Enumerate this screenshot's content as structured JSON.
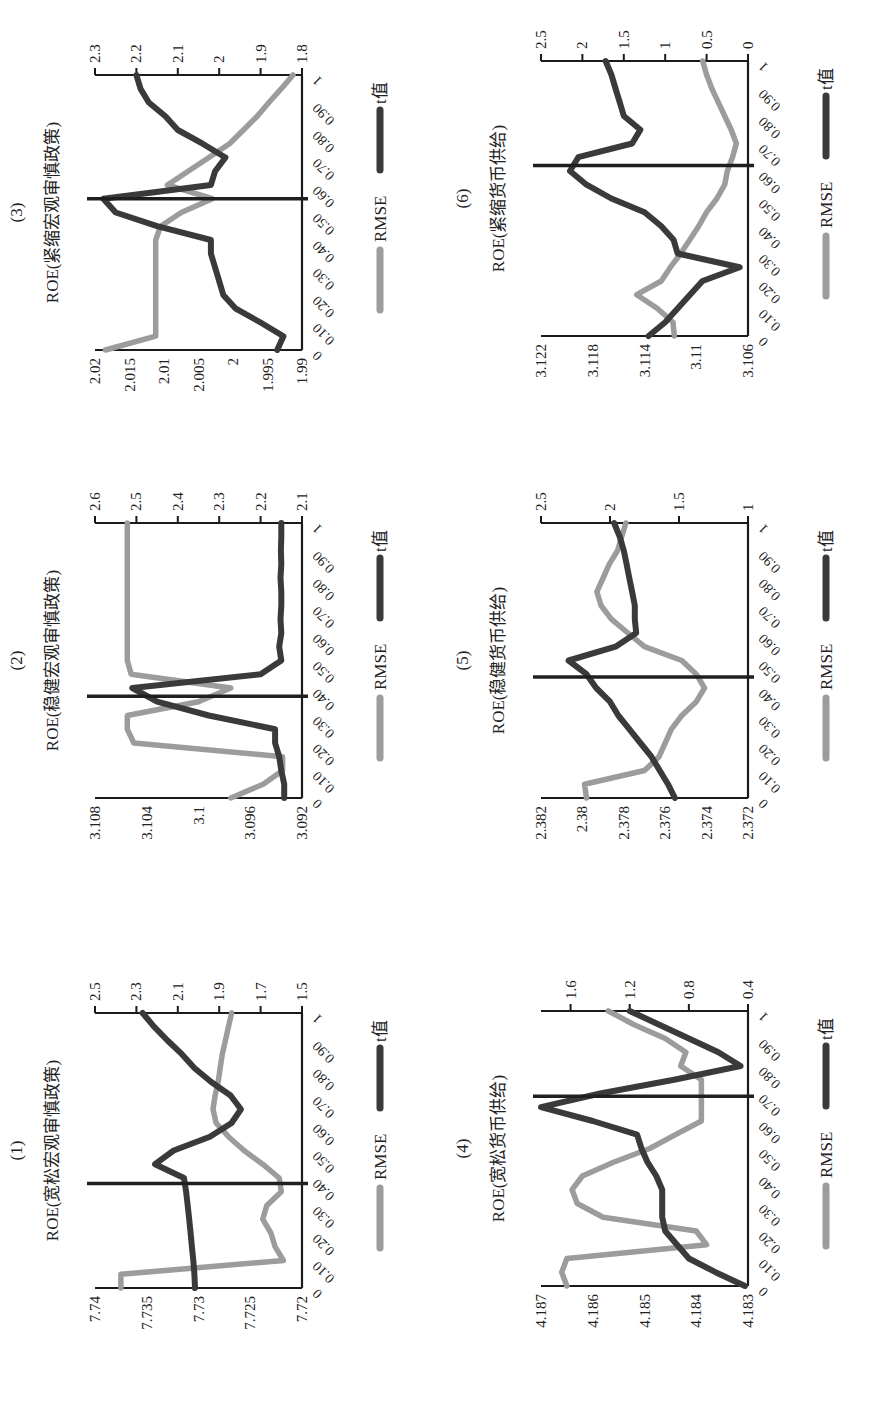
{
  "figure": {
    "legend": {
      "rmse_label": "RMSE",
      "t_label": "t值"
    },
    "colors": {
      "rmse": "#9c9c9c",
      "t": "#3a3a3a",
      "axis": "#1a1a1a",
      "marker": "#1f1f1f"
    }
  },
  "chart_data": [
    {
      "id": "1",
      "number": "(1)",
      "title": "ROE(宽松宏观审慎政策)",
      "type": "line",
      "x": [
        0,
        0.05,
        0.1,
        0.15,
        0.2,
        0.25,
        0.3,
        0.35,
        0.4,
        0.45,
        0.5,
        0.55,
        0.6,
        0.65,
        0.7,
        0.75,
        0.8,
        0.85,
        0.9,
        0.95,
        1
      ],
      "x_tick_labels": [
        "0",
        "0.10",
        "0.20",
        "0.30",
        "0.40",
        "0.50",
        "0.60",
        "0.70",
        "0.80",
        "0.90",
        "1"
      ],
      "y_left": {
        "ticks": [
          "7.74",
          "7.735",
          "7.73",
          "7.725",
          "7.72"
        ],
        "range": [
          7.72,
          7.74
        ]
      },
      "y_right": {
        "ticks": [
          "2.5",
          "2.3",
          "2.1",
          "1.9",
          "1.7",
          "1.5"
        ],
        "range": [
          1.5,
          2.5
        ]
      },
      "marker_x": 0.38,
      "series": [
        {
          "name": "RMSE",
          "axis": "left",
          "values": [
            7.7375,
            7.7375,
            7.7218,
            7.7226,
            7.723,
            7.7238,
            7.7234,
            7.722,
            7.7222,
            7.7238,
            7.7256,
            7.7271,
            7.7283,
            7.7286,
            7.7284,
            7.7281,
            7.7279,
            7.7277,
            7.7274,
            7.7271,
            7.7268
          ]
        },
        {
          "name": "t值",
          "axis": "right",
          "values": [
            2.017,
            2.02,
            2.025,
            2.032,
            2.038,
            2.045,
            2.052,
            2.06,
            2.07,
            2.21,
            2.12,
            1.945,
            1.84,
            1.795,
            1.845,
            1.94,
            2.02,
            2.08,
            2.15,
            2.215,
            2.27
          ]
        }
      ],
      "xlabel": "",
      "grid": false,
      "legend_position": "bottom"
    },
    {
      "id": "2",
      "number": "(2)",
      "title": "ROE(稳健宏观审慎政策)",
      "type": "line",
      "x": [
        0,
        0.05,
        0.1,
        0.15,
        0.2,
        0.25,
        0.3,
        0.35,
        0.4,
        0.45,
        0.5,
        0.55,
        0.6,
        0.65,
        0.7,
        0.75,
        0.8,
        0.85,
        0.9,
        0.95,
        1
      ],
      "x_tick_labels": [
        "0",
        "0.10",
        "0.20",
        "0.30",
        "0.40",
        "0.50",
        "0.60",
        "0.70",
        "0.80",
        "0.90",
        "1"
      ],
      "y_left": {
        "ticks": [
          "3.108",
          "3.104",
          "3.1",
          "3.096",
          "3.092"
        ],
        "range": [
          3.092,
          3.108
        ]
      },
      "y_right": {
        "ticks": [
          "2.6",
          "2.5",
          "2.4",
          "2.3",
          "2.2",
          "2.1"
        ],
        "range": [
          2.1,
          2.6
        ]
      },
      "marker_x": 0.37,
      "series": [
        {
          "name": "RMSE",
          "axis": "left",
          "values": [
            3.0975,
            3.095,
            3.0935,
            3.0935,
            3.105,
            3.1055,
            3.1055,
            3.1,
            3.0975,
            3.1052,
            3.1055,
            3.1055,
            3.1055,
            3.1055,
            3.1055,
            3.1055,
            3.1055,
            3.1055,
            3.1055,
            3.1055,
            3.1055
          ]
        },
        {
          "name": "t值",
          "axis": "right",
          "values": [
            2.143,
            2.143,
            2.15,
            2.155,
            2.165,
            2.165,
            2.325,
            2.45,
            2.51,
            2.2,
            2.15,
            2.155,
            2.15,
            2.152,
            2.15,
            2.15,
            2.152,
            2.15,
            2.151,
            2.15,
            2.15
          ]
        }
      ],
      "xlabel": "",
      "grid": false,
      "legend_position": "bottom"
    },
    {
      "id": "3",
      "number": "(3)",
      "title": "ROE(紧缩宏观审慎政策)",
      "type": "line",
      "x": [
        0,
        0.05,
        0.1,
        0.15,
        0.2,
        0.25,
        0.3,
        0.35,
        0.4,
        0.45,
        0.5,
        0.55,
        0.6,
        0.65,
        0.7,
        0.75,
        0.8,
        0.85,
        0.9,
        0.95,
        1
      ],
      "x_tick_labels": [
        "0",
        "0.10",
        "0.20",
        "0.30",
        "0.40",
        "0.50",
        "0.60",
        "0.70",
        "0.80",
        "0.90",
        "1"
      ],
      "y_left": {
        "ticks": [
          "2.02",
          "2.015",
          "2.01",
          "2.005",
          "2",
          "1.995",
          "1.99"
        ],
        "range": [
          1.99,
          2.02
        ]
      },
      "y_right": {
        "ticks": [
          "2.3",
          "2.2",
          "2.1",
          "2",
          "1.9",
          "1.8"
        ],
        "range": [
          1.8,
          2.3
        ]
      },
      "marker_x": 0.55,
      "series": [
        {
          "name": "RMSE",
          "axis": "left",
          "values": [
            2.0185,
            2.0112,
            2.0112,
            2.0112,
            2.0112,
            2.0112,
            2.0112,
            2.0112,
            2.0112,
            2.0105,
            2.0075,
            2.003,
            2.0095,
            2.0065,
            2.0035,
            2.0005,
            1.9985,
            1.9965,
            1.9948,
            1.993,
            1.9913
          ]
        },
        {
          "name": "t值",
          "axis": "right",
          "values": [
            1.86,
            1.845,
            1.9,
            1.96,
            1.99,
            2.0,
            2.01,
            2.02,
            2.02,
            2.15,
            2.25,
            2.28,
            2.02,
            2.01,
            1.985,
            2.04,
            2.1,
            2.13,
            2.17,
            2.19,
            2.2
          ]
        }
      ],
      "xlabel": "",
      "grid": false,
      "legend_position": "bottom"
    },
    {
      "id": "4",
      "number": "(4)",
      "title": "ROE(宽松货币供给)",
      "type": "line",
      "x": [
        0,
        0.05,
        0.1,
        0.15,
        0.2,
        0.25,
        0.3,
        0.35,
        0.4,
        0.45,
        0.5,
        0.55,
        0.6,
        0.65,
        0.7,
        0.75,
        0.8,
        0.85,
        0.9,
        0.95,
        1
      ],
      "x_tick_labels": [
        "0",
        "0.10",
        "0.20",
        "0.30",
        "0.40",
        "0.50",
        "0.60",
        "0.70",
        "0.80",
        "0.90",
        "1"
      ],
      "y_left": {
        "ticks": [
          "4.187",
          "4.186",
          "4.185",
          "4.184",
          "4.183"
        ],
        "range": [
          4.183,
          4.187
        ]
      },
      "y_right": {
        "ticks": [
          "1.6",
          "1.2",
          "0.8",
          "0.4"
        ],
        "range": [
          0.4,
          1.8
        ]
      },
      "marker_x": 0.69,
      "series": [
        {
          "name": "RMSE",
          "axis": "left",
          "values": [
            4.1865,
            4.1866,
            4.1865,
            4.1838,
            4.184,
            4.1858,
            4.1863,
            4.1864,
            4.1862,
            4.1856,
            4.1849,
            4.1844,
            4.1839,
            4.1839,
            4.1839,
            4.1839,
            4.1843,
            4.1842,
            4.1846,
            4.1852,
            4.1857
          ]
        },
        {
          "name": "t值",
          "axis": "right",
          "values": [
            0.42,
            0.62,
            0.8,
            0.88,
            0.96,
            0.98,
            0.98,
            0.98,
            1.02,
            1.08,
            1.12,
            1.15,
            1.45,
            1.8,
            1.4,
            0.9,
            0.45,
            0.6,
            0.8,
            1.0,
            1.2
          ]
        }
      ],
      "xlabel": "",
      "grid": false,
      "legend_position": "bottom"
    },
    {
      "id": "5",
      "number": "(5)",
      "title": "ROE(稳健货币供给)",
      "type": "line",
      "x": [
        0,
        0.05,
        0.1,
        0.15,
        0.2,
        0.25,
        0.3,
        0.35,
        0.4,
        0.45,
        0.5,
        0.55,
        0.6,
        0.65,
        0.7,
        0.75,
        0.8,
        0.85,
        0.9,
        0.95,
        1
      ],
      "x_tick_labels": [
        "0",
        "0.10",
        "0.20",
        "0.30",
        "0.40",
        "0.50",
        "0.60",
        "0.70",
        "0.80",
        "0.90",
        "1"
      ],
      "y_left": {
        "ticks": [
          "2.382",
          "2.38",
          "2.378",
          "2.376",
          "2.374",
          "2.372"
        ],
        "range": [
          2.372,
          2.382
        ]
      },
      "y_right": {
        "ticks": [
          "2.5",
          "2",
          "1.5",
          "1"
        ],
        "range": [
          1.0,
          2.5
        ]
      },
      "marker_x": 0.44,
      "series": [
        {
          "name": "RMSE",
          "axis": "left",
          "values": [
            2.3798,
            2.3799,
            2.377,
            2.3763,
            2.376,
            2.3757,
            2.3752,
            2.3745,
            2.3741,
            2.3745,
            2.3752,
            2.377,
            2.3778,
            2.3786,
            2.3791,
            2.3793,
            2.379,
            2.3787,
            2.3783,
            2.3781,
            2.3779
          ]
        },
        {
          "name": "t值",
          "axis": "right",
          "values": [
            1.53,
            1.58,
            1.64,
            1.7,
            1.78,
            1.86,
            1.94,
            2.0,
            2.1,
            2.17,
            2.3,
            1.96,
            1.81,
            1.82,
            1.82,
            1.84,
            1.86,
            1.88,
            1.9,
            1.93,
            1.97
          ]
        }
      ],
      "xlabel": "",
      "grid": false,
      "legend_position": "bottom"
    },
    {
      "id": "6",
      "number": "(6)",
      "title": "ROE(紧缩货币供给)",
      "type": "line",
      "x": [
        0,
        0.05,
        0.1,
        0.15,
        0.2,
        0.25,
        0.3,
        0.35,
        0.4,
        0.45,
        0.5,
        0.55,
        0.6,
        0.65,
        0.7,
        0.75,
        0.8,
        0.85,
        0.9,
        0.95,
        1
      ],
      "x_tick_labels": [
        "0",
        "0.10",
        "0.20",
        "0.30",
        "0.40",
        "0.50",
        "0.60",
        "0.70",
        "0.80",
        "0.90",
        "1"
      ],
      "y_left": {
        "ticks": [
          "3.122",
          "3.118",
          "3.114",
          "3.11",
          "3.106"
        ],
        "range": [
          3.106,
          3.122
        ]
      },
      "y_right": {
        "ticks": [
          "2.5",
          "2",
          "1.5",
          "1",
          "0.5",
          "0"
        ],
        "range": [
          0,
          2.5
        ]
      },
      "marker_x": 0.62,
      "series": [
        {
          "name": "RMSE",
          "axis": "left",
          "values": [
            3.1117,
            3.1118,
            3.113,
            3.1146,
            3.1127,
            3.112,
            3.1112,
            3.1105,
            3.1098,
            3.1092,
            3.1084,
            3.1078,
            3.1076,
            3.1072,
            3.1069,
            3.1073,
            3.1078,
            3.1083,
            3.1088,
            3.1092,
            3.1095
          ]
        },
        {
          "name": "t值",
          "axis": "right",
          "values": [
            1.2,
            1.0,
            0.85,
            0.7,
            0.55,
            0.1,
            0.85,
            0.9,
            1.05,
            1.25,
            1.65,
            1.95,
            2.15,
            2.05,
            1.4,
            1.3,
            1.5,
            1.55,
            1.6,
            1.65,
            1.72
          ]
        }
      ],
      "xlabel": "",
      "grid": false,
      "legend_position": "bottom"
    }
  ]
}
